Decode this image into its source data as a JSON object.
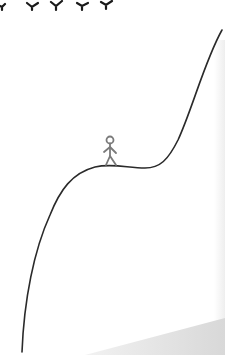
{
  "scene": {
    "description": "Sketch illustration of a stick figure standing on a plateau of a rising curve, with birds flying at the top",
    "colors": {
      "background": "#ffffff",
      "line": "#2a2a2a",
      "figure": "#7a7a7a",
      "bird": "#1a1a1a",
      "shadow": "#dcdcdc",
      "edge_shadow": "#f0f0f0"
    },
    "birds": [
      {
        "x": 2,
        "y": 5
      },
      {
        "x": 33,
        "y": 5
      },
      {
        "x": 57,
        "y": 4
      },
      {
        "x": 82,
        "y": 5
      },
      {
        "x": 106,
        "y": 4
      }
    ],
    "curve": {
      "name": "hill-curve"
    },
    "figure": {
      "name": "stick-figure",
      "x": 110,
      "y": 150
    }
  }
}
